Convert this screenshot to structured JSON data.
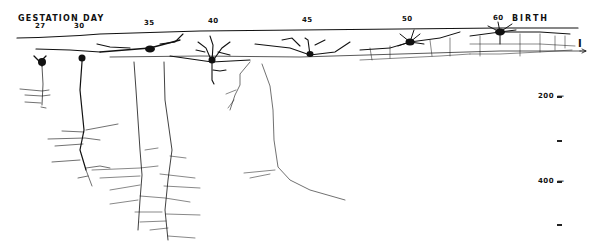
{
  "figure": {
    "header_label": "GESTATION DAY",
    "end_label": "BIRTH",
    "layer_marker": "I",
    "days": [
      {
        "label": "27",
        "x": 38
      },
      {
        "label": "30",
        "x": 77
      },
      {
        "label": "35",
        "x": 146
      },
      {
        "label": "40",
        "x": 208
      },
      {
        "label": "45",
        "x": 302
      },
      {
        "label": "50",
        "x": 404
      },
      {
        "label": "60",
        "x": 494
      }
    ],
    "depth_scale": {
      "unit": "µm",
      "labels": [
        {
          "label": "200",
          "y": 96
        },
        {
          "label": "400",
          "y": 181
        }
      ],
      "minor_ticks_y": [
        140,
        224
      ]
    },
    "line_color": "#111111",
    "background": "#ffffff"
  }
}
